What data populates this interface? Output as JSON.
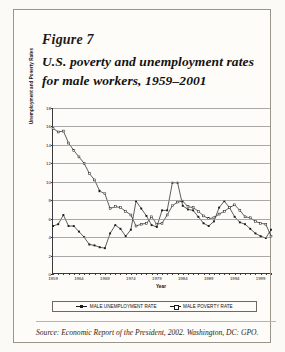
{
  "figure": {
    "label": "Figure 7",
    "title": "U.S. poverty and unemployment rates for male workers, 1959–2001",
    "source": "Source: Economic Report of the President, 2002. Washington, DC: GPO."
  },
  "chart_data": {
    "type": "line",
    "title": "",
    "xlabel": "Year",
    "ylabel": "Unemployment and Poverty Rates",
    "xlim": [
      1959,
      2001
    ],
    "ylim": [
      0,
      18
    ],
    "ytick_step": 2,
    "yticks": [
      0,
      2,
      4,
      6,
      8,
      10,
      12,
      14,
      16,
      18
    ],
    "xticks": [
      1959,
      1964,
      1969,
      1974,
      1979,
      1984,
      1989,
      1994,
      1999
    ],
    "grid": true,
    "legend_position": "bottom",
    "x": [
      1959,
      1960,
      1961,
      1962,
      1963,
      1964,
      1965,
      1966,
      1967,
      1968,
      1969,
      1970,
      1971,
      1972,
      1973,
      1974,
      1975,
      1976,
      1977,
      1978,
      1979,
      1980,
      1981,
      1982,
      1983,
      1984,
      1985,
      1986,
      1987,
      1988,
      1989,
      1990,
      1991,
      1992,
      1993,
      1994,
      1995,
      1996,
      1997,
      1998,
      1999,
      2000,
      2001
    ],
    "series": [
      {
        "name": "MALE UNEMPLOYMENT RATE",
        "marker": "filled-square",
        "values": [
          5.2,
          5.4,
          6.4,
          5.2,
          5.2,
          4.6,
          4.0,
          3.2,
          3.1,
          2.9,
          2.8,
          4.4,
          5.3,
          4.9,
          4.1,
          4.8,
          7.9,
          7.1,
          6.3,
          5.3,
          5.1,
          6.9,
          6.9,
          9.9,
          9.9,
          7.4,
          7.0,
          6.9,
          6.2,
          5.5,
          5.2,
          5.7,
          7.2,
          7.9,
          7.2,
          6.2,
          5.6,
          5.4,
          4.9,
          4.4,
          4.1,
          3.9,
          4.8
        ]
      },
      {
        "name": "MALE POVERTY RATE",
        "marker": "hollow-square",
        "values": [
          15.8,
          15.4,
          15.5,
          14.2,
          13.4,
          12.7,
          12.0,
          10.9,
          10.2,
          9.0,
          8.7,
          7.1,
          7.3,
          7.2,
          6.8,
          6.4,
          5.2,
          5.4,
          5.5,
          6.2,
          5.4,
          5.5,
          6.4,
          7.4,
          7.8,
          7.9,
          7.3,
          7.2,
          6.8,
          6.3,
          6.0,
          6.1,
          6.5,
          6.8,
          7.2,
          7.5,
          6.9,
          6.2,
          6.1,
          5.7,
          5.5,
          5.4,
          4.1
        ]
      }
    ]
  },
  "legend": {
    "items": [
      {
        "label": "MALE UNEMPLOYMENT RATE"
      },
      {
        "label": "MALE POVERTY RATE"
      }
    ]
  }
}
